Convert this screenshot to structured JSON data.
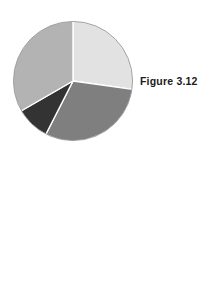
{
  "page": {
    "background_color": "#ffffff",
    "width": 218,
    "height": 293
  },
  "figures": [
    {
      "id": "figure-3-12",
      "caption": "Figure 3.12",
      "caption_position": "right-of-chart"
    },
    {
      "id": "figure-3-13",
      "caption": "Figure 3.13",
      "caption_position": "left-of-chart"
    }
  ],
  "chart_data": [
    {
      "type": "pie",
      "title": "Figure 3.12",
      "xlabel": "",
      "ylabel": "",
      "legend": "none",
      "grid": false,
      "start_angle_deg": 0,
      "direction": "clockwise",
      "center": {
        "x": 73,
        "y": 81
      },
      "radius": 60,
      "categories": [
        "Slice 1",
        "Slice 2",
        "Slice 3",
        "Slice 4"
      ],
      "values": [
        27,
        30,
        9,
        34
      ],
      "slices": [
        {
          "label": "Slice 1",
          "value": 27,
          "start_deg": 0,
          "end_deg": 98,
          "color": "#e2e2e2"
        },
        {
          "label": "Slice 2",
          "value": 30,
          "start_deg": 98,
          "end_deg": 207,
          "color": "#7f7f7f"
        },
        {
          "label": "Slice 3",
          "value": 9,
          "start_deg": 207,
          "end_deg": 240,
          "color": "#333333"
        },
        {
          "label": "Slice 4",
          "value": 34,
          "start_deg": 240,
          "end_deg": 360,
          "color": "#b3b3b3"
        }
      ]
    },
    {
      "type": "pie",
      "title": "Figure 3.13",
      "xlabel": "",
      "ylabel": "",
      "legend": "none",
      "grid": false,
      "start_angle_deg": 0,
      "direction": "clockwise",
      "center": {
        "x": 131,
        "y": 232
      },
      "radius": 47,
      "categories": [
        "Slice 1",
        "Slice 2",
        "Slice 3"
      ],
      "values": [
        28,
        31,
        41
      ],
      "slices": [
        {
          "label": "Slice 1",
          "value": 28,
          "start_deg": 0,
          "end_deg": 100,
          "color": "#e2e2e2"
        },
        {
          "label": "Slice 2",
          "value": 31,
          "start_deg": 100,
          "end_deg": 212,
          "color": "#7f7f7f"
        },
        {
          "label": "Slice 3",
          "value": 41,
          "start_deg": 212,
          "end_deg": 360,
          "color": "#b3b3b3"
        }
      ]
    }
  ]
}
